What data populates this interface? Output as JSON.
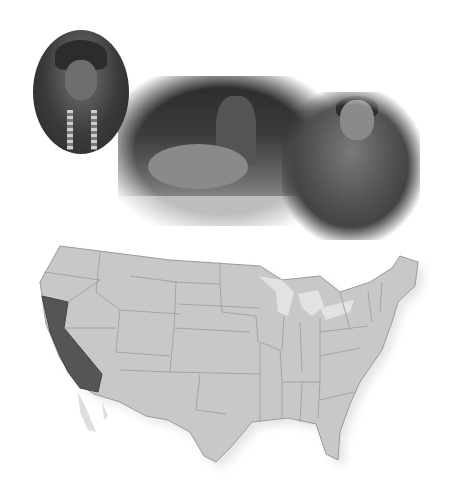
{
  "image": {
    "description": "Collage of three historical black-and-white photographs above a grayscale map of the contiguous United States",
    "photos": [
      {
        "id": "portrait-oval",
        "subject": "oval portrait of a young person with long hair and beaded necklaces"
      },
      {
        "id": "basket-weaver",
        "subject": "seated person beside a large woven basket and bundles of grass"
      },
      {
        "id": "elder-portrait",
        "subject": "elderly man seated, wearing a jacket"
      }
    ],
    "map": {
      "region": "Contiguous United States",
      "highlighted_state": "California",
      "colors": {
        "land": "#c8c8c8",
        "highlight": "#555555",
        "border": "#8a8a8a",
        "lakes": "#e0e0e0"
      }
    }
  }
}
